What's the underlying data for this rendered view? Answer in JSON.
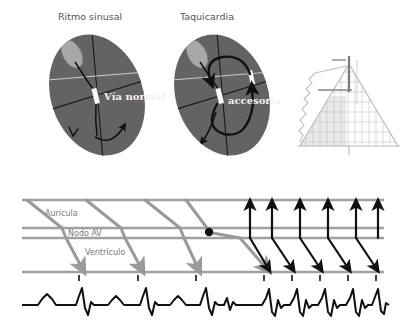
{
  "figure": {
    "kind": "cardiac-arrhythmia-diagram",
    "background_color": "#ffffff"
  },
  "panels": {
    "left_heart": {
      "title": "Ritmo sinusal",
      "pathway_label": "Vía normal",
      "fill_color": "#636363",
      "node_color": "#ffffff",
      "sinus_node_color": "#a8a8a8"
    },
    "right_heart": {
      "title": "Taquicardia",
      "pathway_label": "accesoria",
      "fill_color": "#636363",
      "node_color": "#ffffff",
      "sinus_node_color": "#a8a8a8"
    },
    "triangle_inset": {
      "line_color": "#b9b9b9",
      "accent_color": "#3a3a3a"
    }
  },
  "ladder": {
    "bands": [
      {
        "label": "Aurícula"
      },
      {
        "label": "Nodo AV"
      },
      {
        "label": "Ventrículo"
      }
    ],
    "normal_color": "#9a9a9a",
    "reentry_color": "#111111",
    "rail_color": "#a0a0a0",
    "normal_beats": 4,
    "reentry_beats": 5
  },
  "ecg": {
    "trace_color": "#111111",
    "sinus_beats": 4,
    "tachy_beats": 5
  }
}
